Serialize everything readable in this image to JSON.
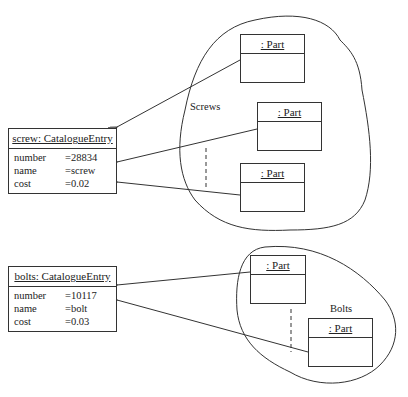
{
  "screw_entry": {
    "title": "screw: CatalogueEntry",
    "attributes": [
      {
        "name": "number",
        "value": "=28834"
      },
      {
        "name": "name",
        "value": "=screw"
      },
      {
        "name": "cost",
        "value": "=0.02"
      }
    ]
  },
  "bolt_entry": {
    "title": "bolts: CatalogueEntry",
    "attributes": [
      {
        "name": "number",
        "value": "=10117"
      },
      {
        "name": "name",
        "value": "=bolt"
      },
      {
        "name": "cost",
        "value": "=0.03"
      }
    ]
  },
  "screws_group": {
    "label": "Screws",
    "parts": [
      ": Part",
      ": Part",
      ": Part"
    ]
  },
  "bolts_group": {
    "label": "Bolts",
    "parts": [
      ": Part",
      ": Part"
    ]
  }
}
